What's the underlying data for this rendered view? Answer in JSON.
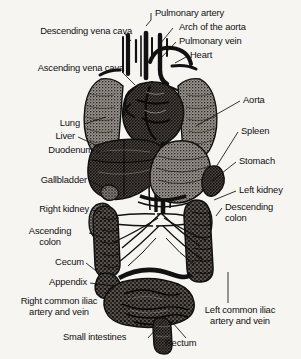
{
  "figure": {
    "style": "black and white halftone engraving with leader-line callouts",
    "background_color": "#f7f5f1",
    "ink_color": "#111111",
    "width": 301,
    "height": 359
  },
  "labels": {
    "descending_vena_cava": "Descending vena cava",
    "ascending_vena_cava": "Ascending vena cava",
    "pulmonary_artery": "Pulmonary artery",
    "arch_of_the_aorta": "Arch of the aorta",
    "pulmonary_vein": "Pulmonary vein",
    "heart": "Heart",
    "aorta": "Aorta",
    "spleen": "Spleen",
    "lung": "Lung",
    "liver": "Liver",
    "duodenum": "Duodenum",
    "stomach": "Stomach",
    "gallbladder": "Gallbladder",
    "left_kidney": "Left kidney",
    "right_kidney": "Right kidney",
    "descending_colon_l1": "Descending",
    "descending_colon_l2": "colon",
    "ascending_colon_l1": "Ascending",
    "ascending_colon_l2": "colon",
    "cecum": "Cecum",
    "appendix": "Appendix",
    "right_common_iliac_l1": "Right common iliac",
    "right_common_iliac_l2": "artery and vein",
    "left_common_iliac_l1": "Left common iliac",
    "left_common_iliac_l2": "artery and vein",
    "small_intestines": "Small intestines",
    "rectum": "Rectum"
  }
}
